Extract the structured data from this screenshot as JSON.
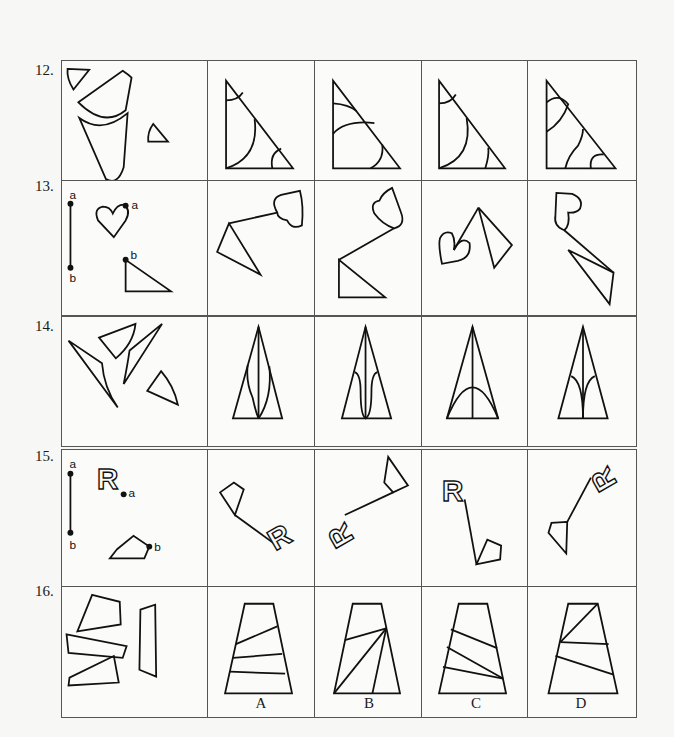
{
  "questions": [
    {
      "number": "12.",
      "options": [
        "A",
        "B",
        "C",
        "D"
      ]
    },
    {
      "number": "13.",
      "options": [
        "A",
        "B",
        "C",
        "D"
      ],
      "point_labels": {
        "a": "a",
        "b": "b"
      }
    },
    {
      "number": "14.",
      "options": [
        "A",
        "B",
        "C",
        "D"
      ]
    },
    {
      "number": "15.",
      "options": [
        "A",
        "B",
        "C",
        "D"
      ],
      "point_labels": {
        "a": "a",
        "b": "b"
      },
      "glyph": "R"
    },
    {
      "number": "16.",
      "options": [
        "A",
        "B",
        "C",
        "D"
      ]
    }
  ]
}
